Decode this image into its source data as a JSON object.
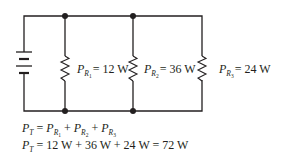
{
  "diagram": {
    "type": "parallel-circuit",
    "colors": {
      "wire": "#231f20",
      "background": "#ffffff"
    },
    "source": {
      "kind": "battery",
      "icon": "battery-icon"
    },
    "resistors": [
      {
        "id": "R1",
        "label_main": "P",
        "label_sub": "R",
        "label_subsub": "1",
        "value": "= 12 W"
      },
      {
        "id": "R2",
        "label_main": "P",
        "label_sub": "R",
        "label_subsub": "2",
        "value": "= 36 W"
      },
      {
        "id": "R3",
        "label_main": "P",
        "label_sub": "R",
        "label_subsub": "3",
        "value": "= 24 W"
      }
    ],
    "equations": {
      "line1": {
        "lhs_main": "P",
        "lhs_sub": "T",
        "eq": " = ",
        "terms": [
          {
            "main": "P",
            "sub": "R",
            "subsub": "1"
          },
          {
            "main": "P",
            "sub": "R",
            "subsub": "2"
          },
          {
            "main": "P",
            "sub": "R",
            "subsub": "3"
          }
        ],
        "plus": " + "
      },
      "line2": {
        "lhs_main": "P",
        "lhs_sub": "T",
        "rhs": " = 12 W + 36 W + 24 W = 72 W"
      }
    }
  }
}
